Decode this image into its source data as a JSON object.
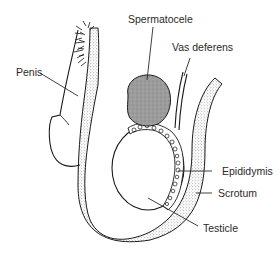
{
  "diagram": {
    "labels": {
      "penis": "Penis",
      "spermatocele": "Spermatocele",
      "vas_deferens": "Vas deferens",
      "epididymis": "Epididymis",
      "scrotum": "Scrotum",
      "testicle": "Testicle"
    },
    "colors": {
      "line": "#1a1a1a",
      "stipple": "#c8c8c8",
      "cyst_fill": "#9a9a9a",
      "background": "#ffffff"
    }
  }
}
